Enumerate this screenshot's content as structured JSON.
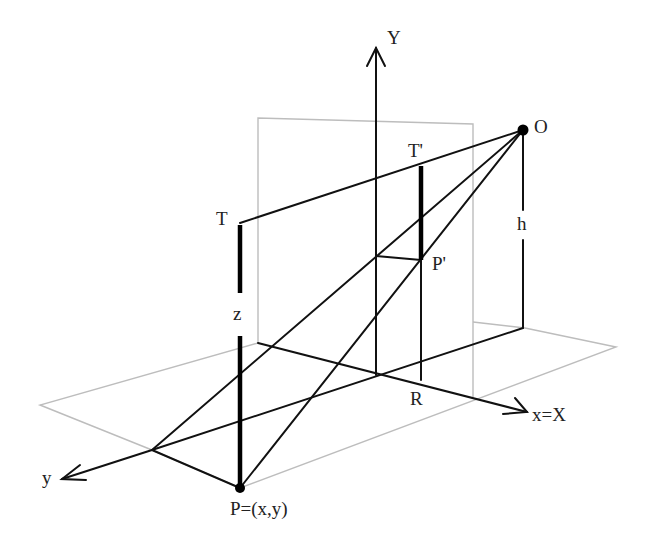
{
  "diagram": {
    "type": "perspective-projection-geometry",
    "labels": {
      "Y_axis": "Y",
      "O": "O",
      "T_prime": "T'",
      "T": "T",
      "h": "h",
      "P_prime": "P'",
      "z": "z",
      "R": "R",
      "x_axis": "x=X",
      "y_axis": "y",
      "P": "P=(x,y)"
    },
    "colors": {
      "line": "#111111",
      "plane": "#bdbdbd",
      "background": "#ffffff"
    }
  }
}
